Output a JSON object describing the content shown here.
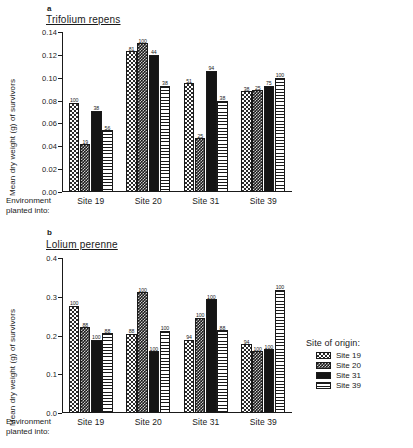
{
  "legend": {
    "title": "Site of origin:",
    "items": [
      {
        "label": "Site 19",
        "pattern": "checker-light"
      },
      {
        "label": "Site 20",
        "pattern": "checker-dark"
      },
      {
        "label": "Site 31",
        "pattern": "solid-black"
      },
      {
        "label": "Site 39",
        "pattern": "horizontal-lines"
      }
    ]
  },
  "panels": [
    {
      "letter": "a",
      "species": "Trifolium repens",
      "ylabel": "Mean dry weight (g) of survivors",
      "xcaption_line1": "Environment",
      "xcaption_line2": "planted into:"
    },
    {
      "letter": "b",
      "species": "Lolium perenne",
      "ylabel": "Mean dry weight (g) of survivors",
      "xcaption_line1": "Environment",
      "xcaption_line2": "planted into:"
    }
  ],
  "chart_data": [
    {
      "type": "bar",
      "title": "Trifolium repens",
      "panel": "a",
      "xlabel": "Environment planted into:",
      "ylabel": "Mean dry weight (g) of survivors",
      "ylim": [
        0.0,
        0.14
      ],
      "yticks": [
        "0.00",
        "0.02",
        "0.04",
        "0.06",
        "0.08",
        "0.10",
        "0.12",
        "0.14"
      ],
      "ytick_values": [
        0.0,
        0.02,
        0.04,
        0.06,
        0.08,
        0.1,
        0.12,
        0.14
      ],
      "categories": [
        "Site 19",
        "Site 20",
        "Site 31",
        "Site 39"
      ],
      "grid": false,
      "legend_position": "right-outside",
      "series": [
        {
          "name": "Site 19",
          "values": [
            0.078,
            0.123,
            0.095,
            0.088
          ],
          "labels": [
            "100",
            "81",
            "51",
            "38"
          ]
        },
        {
          "name": "Site 20",
          "values": [
            0.042,
            0.13,
            0.047,
            0.089
          ],
          "labels": [
            "19",
            "100",
            "25",
            "25"
          ]
        },
        {
          "name": "Site 31",
          "values": [
            0.071,
            0.12,
            0.106,
            0.093
          ],
          "labels": [
            "38",
            "44",
            "94",
            "75"
          ]
        },
        {
          "name": "Site 39",
          "values": [
            0.054,
            0.093,
            0.08,
            0.1
          ],
          "labels": [
            "56",
            "38",
            "38",
            "100"
          ]
        }
      ]
    },
    {
      "type": "bar",
      "title": "Lolium perenne",
      "panel": "b",
      "xlabel": "Environment planted into:",
      "ylabel": "Mean dry weight (g) of survivors",
      "ylim": [
        0.0,
        0.4
      ],
      "yticks": [
        "0.0",
        "0.1",
        "0.2",
        "0.3",
        "0.4"
      ],
      "ytick_values": [
        0.0,
        0.1,
        0.2,
        0.3,
        0.4
      ],
      "categories": [
        "Site 19",
        "Site 20",
        "Site 31",
        "Site 39"
      ],
      "grid": false,
      "legend_position": "right-outside",
      "series": [
        {
          "name": "Site 19",
          "values": [
            0.277,
            0.205,
            0.189,
            0.178
          ],
          "labels": [
            "100",
            "88",
            "94",
            "94"
          ]
        },
        {
          "name": "Site 20",
          "values": [
            0.221,
            0.312,
            0.246,
            0.16
          ],
          "labels": [
            "88",
            "100",
            "100",
            "100"
          ]
        },
        {
          "name": "Site 31",
          "values": [
            0.189,
            0.16,
            0.293,
            0.165
          ],
          "labels": [
            "100",
            "100",
            "100",
            "100"
          ]
        },
        {
          "name": "Site 39",
          "values": [
            0.206,
            0.212,
            0.213,
            0.318
          ],
          "labels": [
            "88",
            "100",
            "88",
            "100"
          ]
        }
      ]
    }
  ]
}
